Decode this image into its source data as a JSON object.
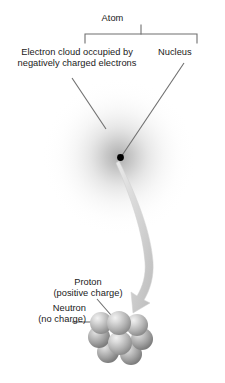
{
  "figure": {
    "background_color": "#ffffff",
    "text_color": "#1a1a1a",
    "line_color": "#6f6f6f",
    "cloud_color": "#c9c9c9",
    "nucleus_dot_color": "#000000",
    "arrow_color": "#d0d0d0",
    "particle_color": "#b8b8b8"
  },
  "labels": {
    "atom": "Atom",
    "electron_cloud": "Electron cloud occupied by\nnegatively charged electrons",
    "nucleus": "Nucleus",
    "proton": "Proton\n(positive charge)",
    "neutron": "Neutron\n(no charge)"
  }
}
